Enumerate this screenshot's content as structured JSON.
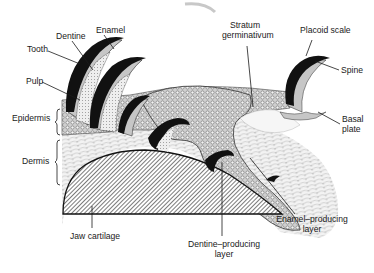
{
  "diagram": {
    "labels": {
      "tooth": "Tooth",
      "dentine": "Dentine",
      "enamel": "Enamel",
      "pulp": "Pulp",
      "epidermis": "Epidermis",
      "dermis": "Dermis",
      "jaw_cartilage": "Jaw cartilage",
      "stratum_line1": "Stratum",
      "stratum_line2": "germinativum",
      "placoid_scale": "Placoid scale",
      "spine": "Spine",
      "basal_line1": "Basal",
      "basal_line2": "plate",
      "dentine_layer_line1": "Dentine–producing",
      "dentine_layer_line2": "layer",
      "enamel_layer_line1": "Enamel–producing",
      "enamel_layer_line2": "layer"
    },
    "colors": {
      "ink": "#1a1a1a",
      "enamel": "#111111",
      "epidermis_fill": "#d9d9d9",
      "dermis_fill": "#f1f1f1",
      "cartilage_fill": "#9a9a9a",
      "background": "#ffffff"
    }
  }
}
